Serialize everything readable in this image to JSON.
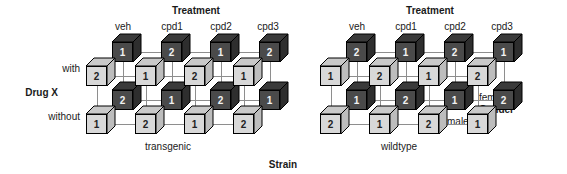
{
  "figure": {
    "title_hidden": "",
    "axis_labels": {
      "treatment": "Treatment",
      "drug": "Drug X",
      "gender": "Gender",
      "strain": "Strain"
    },
    "treatment_levels": [
      "veh",
      "cpd1",
      "cpd2",
      "cpd3"
    ],
    "drug_levels": [
      "with",
      "without"
    ],
    "gender_levels": [
      "female",
      "male"
    ],
    "strain_levels": [
      "transgenic",
      "wildtype"
    ]
  },
  "colors": {
    "dark_cube_front": "#4a4a4a",
    "dark_cube_top": "#3a3a3a",
    "dark_cube_side": "#2e2e2e",
    "light_cube_front": "#d8d8d8",
    "light_cube_top": "#c9c9c9",
    "light_cube_side": "#bdbdbd",
    "edge": "#000000",
    "connector": "#8e8e8e",
    "text": "#1a1a1a"
  },
  "chart_data": {
    "type": "diagram",
    "factors": [
      "Strain",
      "Treatment",
      "Drug X",
      "Gender"
    ],
    "cell_label_meaning": "replicate block number (1 or 2)",
    "panels": [
      {
        "strain": "transgenic",
        "columns": [
          {
            "treatment": "veh",
            "cells": [
              {
                "drug": "with",
                "gender": "female",
                "value": "1",
                "shade": "dark"
              },
              {
                "drug": "with",
                "gender": "male",
                "value": "2",
                "shade": "light"
              },
              {
                "drug": "without",
                "gender": "female",
                "value": "2",
                "shade": "dark"
              },
              {
                "drug": "without",
                "gender": "male",
                "value": "1",
                "shade": "light"
              }
            ]
          },
          {
            "treatment": "cpd1",
            "cells": [
              {
                "drug": "with",
                "gender": "female",
                "value": "2",
                "shade": "dark"
              },
              {
                "drug": "with",
                "gender": "male",
                "value": "1",
                "shade": "light"
              },
              {
                "drug": "without",
                "gender": "female",
                "value": "1",
                "shade": "dark"
              },
              {
                "drug": "without",
                "gender": "male",
                "value": "2",
                "shade": "light"
              }
            ]
          },
          {
            "treatment": "cpd2",
            "cells": [
              {
                "drug": "with",
                "gender": "female",
                "value": "1",
                "shade": "dark"
              },
              {
                "drug": "with",
                "gender": "male",
                "value": "2",
                "shade": "light"
              },
              {
                "drug": "without",
                "gender": "female",
                "value": "2",
                "shade": "dark"
              },
              {
                "drug": "without",
                "gender": "male",
                "value": "1",
                "shade": "light"
              }
            ]
          },
          {
            "treatment": "cpd3",
            "cells": [
              {
                "drug": "with",
                "gender": "female",
                "value": "2",
                "shade": "dark"
              },
              {
                "drug": "with",
                "gender": "male",
                "value": "1",
                "shade": "light"
              },
              {
                "drug": "without",
                "gender": "female",
                "value": "1",
                "shade": "dark"
              },
              {
                "drug": "without",
                "gender": "male",
                "value": "2",
                "shade": "light"
              }
            ]
          }
        ]
      },
      {
        "strain": "wildtype",
        "columns": [
          {
            "treatment": "veh",
            "cells": [
              {
                "drug": "with",
                "gender": "female",
                "value": "2",
                "shade": "dark"
              },
              {
                "drug": "with",
                "gender": "male",
                "value": "1",
                "shade": "light"
              },
              {
                "drug": "without",
                "gender": "female",
                "value": "1",
                "shade": "dark"
              },
              {
                "drug": "without",
                "gender": "male",
                "value": "2",
                "shade": "light"
              }
            ]
          },
          {
            "treatment": "cpd1",
            "cells": [
              {
                "drug": "with",
                "gender": "female",
                "value": "1",
                "shade": "dark"
              },
              {
                "drug": "with",
                "gender": "male",
                "value": "2",
                "shade": "light"
              },
              {
                "drug": "without",
                "gender": "female",
                "value": "2",
                "shade": "dark"
              },
              {
                "drug": "without",
                "gender": "male",
                "value": "1",
                "shade": "light"
              }
            ]
          },
          {
            "treatment": "cpd2",
            "cells": [
              {
                "drug": "with",
                "gender": "female",
                "value": "2",
                "shade": "dark"
              },
              {
                "drug": "with",
                "gender": "male",
                "value": "1",
                "shade": "light"
              },
              {
                "drug": "without",
                "gender": "female",
                "value": "1",
                "shade": "dark"
              },
              {
                "drug": "without",
                "gender": "male",
                "value": "2",
                "shade": "light"
              }
            ]
          },
          {
            "treatment": "cpd3",
            "cells": [
              {
                "drug": "with",
                "gender": "female",
                "value": "1",
                "shade": "dark"
              },
              {
                "drug": "with",
                "gender": "male",
                "value": "2",
                "shade": "light"
              },
              {
                "drug": "without",
                "gender": "female",
                "value": "2",
                "shade": "dark"
              },
              {
                "drug": "without",
                "gender": "male",
                "value": "1",
                "shade": "light"
              }
            ]
          }
        ]
      }
    ]
  }
}
